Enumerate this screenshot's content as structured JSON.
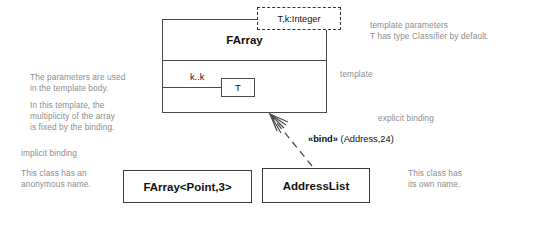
{
  "diagram": {
    "template_class": {
      "name": "FArray",
      "template_parameters": "T,k:Integer",
      "body": {
        "multiplicity": "k..k",
        "type_box": "T"
      }
    },
    "bound_classes": [
      {
        "name": "FArray<Point,3>"
      },
      {
        "name": "AddressList"
      }
    ],
    "binding_dependency": {
      "stereotype": "«bind»",
      "arguments": " (Address,24)"
    },
    "annotations": {
      "template_parameters_note": "template parameters\nT has type Classifier by default.",
      "template_note": "template",
      "parameters_used_note": "The parameters are used\nin the template body.",
      "multiplicity_note": "In this template, the\nmultiplicity of the array\nis fixed by the binding.",
      "explicit_binding_note": "explicit binding",
      "implicit_binding_note": "implicit binding",
      "anonymous_name_note": "This class has an\nanonymous name.",
      "own_name_note": "This class has\nits own name."
    }
  },
  "colors": {
    "annotation_text": "#8d8d8d",
    "box_border": "#4a4a4a",
    "primary_text": "#111111"
  }
}
